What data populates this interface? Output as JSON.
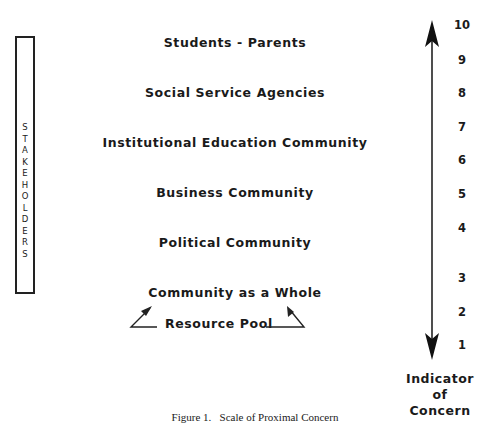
{
  "figure": {
    "caption": "Figure 1.   Scale of Proximal Concern",
    "side_label": {
      "text": "STAKEHOLDERS",
      "letters": [
        "S",
        "T",
        "A",
        "K",
        "E",
        "H",
        "O",
        "L",
        "D",
        "E",
        "R",
        "S"
      ]
    },
    "stakeholders": [
      {
        "label": "Students - Parents",
        "level": 10
      },
      {
        "label": "Social Service Agencies",
        "level": 8
      },
      {
        "label": "Institutional Education Community",
        "level": 7
      },
      {
        "label": "Business Community",
        "level": 5
      },
      {
        "label": "Political Community",
        "level": 4
      },
      {
        "label": "Community as a Whole",
        "level": 2
      }
    ],
    "resource_pool": {
      "label": "Resource Pool",
      "arrows": [
        "left-arrow-up-to-community",
        "right-arrow-up-to-community"
      ]
    },
    "scale": {
      "ticks": [
        "10",
        "9",
        "8",
        "7",
        "6",
        "5",
        "4",
        "3",
        "2",
        "1"
      ],
      "axis_label": [
        "Indicator",
        "of",
        "Concern"
      ],
      "arrow": "double-headed-vertical"
    }
  }
}
